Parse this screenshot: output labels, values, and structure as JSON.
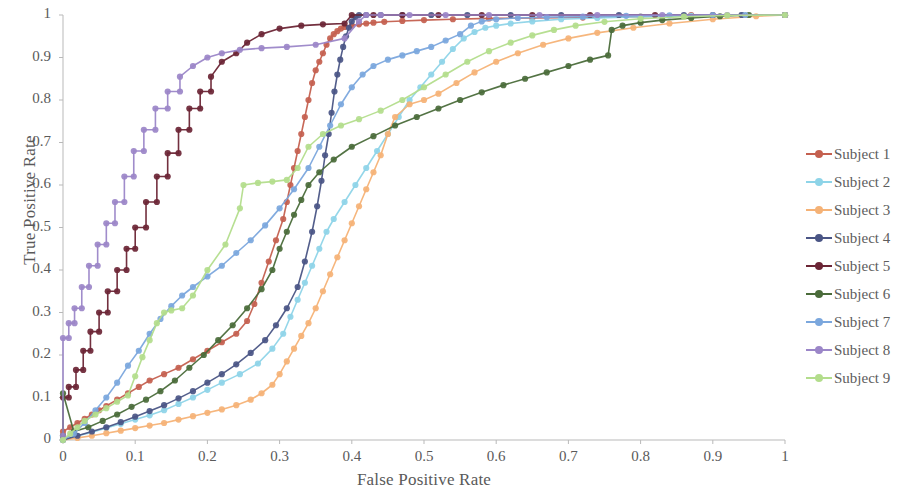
{
  "chart_data": {
    "type": "line",
    "title": "",
    "xlabel": "False Positive Rate",
    "ylabel": "True Positive Rate",
    "xlim": [
      0,
      1
    ],
    "ylim": [
      0,
      1
    ],
    "xticks": [
      "0",
      "0.1",
      "0.2",
      "0.3",
      "0.4",
      "0.5",
      "0.6",
      "0.7",
      "0.8",
      "0.9",
      "1"
    ],
    "yticks": [
      "0",
      "0.1",
      "0.2",
      "0.3",
      "0.4",
      "0.5",
      "0.6",
      "0.7",
      "0.8",
      "0.9",
      "1"
    ],
    "grid": false,
    "legend_position": "right",
    "marker": "circle",
    "series": [
      {
        "name": "Subject 1",
        "color": "#c4604f",
        "x": [
          0.0,
          0.01,
          0.02,
          0.03,
          0.04,
          0.05,
          0.06,
          0.075,
          0.09,
          0.105,
          0.12,
          0.14,
          0.16,
          0.18,
          0.2,
          0.22,
          0.24,
          0.255,
          0.265,
          0.275,
          0.285,
          0.295,
          0.305,
          0.31,
          0.315,
          0.32,
          0.325,
          0.33,
          0.335,
          0.34,
          0.345,
          0.35,
          0.355,
          0.36,
          0.365,
          0.37,
          0.375,
          0.38,
          0.385,
          0.39,
          0.4,
          0.41,
          0.42,
          0.43,
          0.445,
          0.47,
          0.5,
          0.54,
          0.59,
          0.65,
          0.72,
          0.8,
          0.87,
          0.94,
          1.0
        ],
        "y": [
          0.02,
          0.03,
          0.04,
          0.05,
          0.06,
          0.07,
          0.08,
          0.095,
          0.11,
          0.125,
          0.14,
          0.155,
          0.17,
          0.19,
          0.21,
          0.23,
          0.25,
          0.28,
          0.32,
          0.37,
          0.42,
          0.47,
          0.52,
          0.56,
          0.6,
          0.64,
          0.68,
          0.72,
          0.76,
          0.8,
          0.84,
          0.87,
          0.89,
          0.91,
          0.93,
          0.945,
          0.955,
          0.962,
          0.968,
          0.972,
          0.975,
          0.978,
          0.98,
          0.982,
          0.984,
          0.986,
          0.988,
          0.99,
          0.992,
          0.993,
          0.994,
          0.996,
          1.0,
          1.0,
          1.0
        ]
      },
      {
        "name": "Subject 2",
        "color": "#8ed4e8",
        "x": [
          0.0,
          0.02,
          0.04,
          0.06,
          0.08,
          0.1,
          0.12,
          0.14,
          0.16,
          0.18,
          0.2,
          0.22,
          0.245,
          0.27,
          0.29,
          0.305,
          0.315,
          0.325,
          0.335,
          0.345,
          0.355,
          0.365,
          0.375,
          0.39,
          0.405,
          0.42,
          0.435,
          0.45,
          0.465,
          0.48,
          0.495,
          0.51,
          0.525,
          0.54,
          0.555,
          0.57,
          0.585,
          0.6,
          0.62,
          0.65,
          0.69,
          0.74,
          0.8,
          0.87,
          0.94,
          1.0
        ],
        "y": [
          0.0,
          0.01,
          0.018,
          0.028,
          0.038,
          0.048,
          0.058,
          0.07,
          0.085,
          0.1,
          0.118,
          0.135,
          0.155,
          0.18,
          0.215,
          0.25,
          0.29,
          0.33,
          0.37,
          0.41,
          0.45,
          0.49,
          0.52,
          0.56,
          0.6,
          0.64,
          0.68,
          0.72,
          0.76,
          0.8,
          0.83,
          0.86,
          0.89,
          0.92,
          0.945,
          0.96,
          0.97,
          0.975,
          0.98,
          0.985,
          0.99,
          0.993,
          0.996,
          0.998,
          1.0,
          1.0
        ]
      },
      {
        "name": "Subject 3",
        "color": "#f5b276",
        "x": [
          0.0,
          0.02,
          0.04,
          0.06,
          0.08,
          0.1,
          0.12,
          0.14,
          0.16,
          0.18,
          0.2,
          0.22,
          0.24,
          0.26,
          0.275,
          0.29,
          0.3,
          0.31,
          0.32,
          0.33,
          0.34,
          0.35,
          0.36,
          0.37,
          0.38,
          0.39,
          0.4,
          0.41,
          0.42,
          0.43,
          0.44,
          0.45,
          0.46,
          0.48,
          0.5,
          0.52,
          0.545,
          0.57,
          0.6,
          0.63,
          0.665,
          0.7,
          0.74,
          0.79,
          0.84,
          0.9,
          0.96,
          1.0
        ],
        "y": [
          0.0,
          0.005,
          0.01,
          0.016,
          0.022,
          0.028,
          0.034,
          0.04,
          0.048,
          0.056,
          0.064,
          0.072,
          0.082,
          0.095,
          0.11,
          0.13,
          0.155,
          0.185,
          0.215,
          0.245,
          0.275,
          0.31,
          0.35,
          0.39,
          0.43,
          0.47,
          0.51,
          0.55,
          0.59,
          0.63,
          0.67,
          0.72,
          0.76,
          0.79,
          0.8,
          0.815,
          0.84,
          0.865,
          0.89,
          0.91,
          0.93,
          0.945,
          0.958,
          0.97,
          0.98,
          0.99,
          0.997,
          1.0
        ]
      },
      {
        "name": "Subject 4",
        "color": "#4a5585",
        "x": [
          0.0,
          0.02,
          0.04,
          0.06,
          0.08,
          0.1,
          0.12,
          0.14,
          0.16,
          0.18,
          0.2,
          0.22,
          0.24,
          0.26,
          0.28,
          0.295,
          0.31,
          0.325,
          0.335,
          0.345,
          0.352,
          0.358,
          0.363,
          0.368,
          0.372,
          0.376,
          0.38,
          0.384,
          0.388,
          0.392,
          0.396,
          0.4,
          0.405,
          0.41,
          0.42,
          0.44,
          0.47,
          0.51,
          0.56,
          0.62,
          0.69,
          0.77,
          0.86,
          0.94,
          1.0
        ],
        "y": [
          0.0,
          0.01,
          0.02,
          0.03,
          0.042,
          0.055,
          0.068,
          0.082,
          0.098,
          0.115,
          0.135,
          0.155,
          0.178,
          0.205,
          0.235,
          0.27,
          0.31,
          0.36,
          0.42,
          0.49,
          0.55,
          0.61,
          0.67,
          0.72,
          0.77,
          0.82,
          0.86,
          0.895,
          0.925,
          0.95,
          0.97,
          0.985,
          0.995,
          1.0,
          1.0,
          1.0,
          1.0,
          1.0,
          1.0,
          1.0,
          1.0,
          1.0,
          1.0,
          1.0,
          1.0
        ]
      },
      {
        "name": "Subject 5",
        "color": "#6b2535",
        "x": [
          0.0,
          0.0,
          0.008,
          0.008,
          0.018,
          0.018,
          0.028,
          0.028,
          0.038,
          0.038,
          0.05,
          0.05,
          0.062,
          0.062,
          0.075,
          0.075,
          0.088,
          0.088,
          0.1,
          0.1,
          0.115,
          0.115,
          0.13,
          0.13,
          0.145,
          0.145,
          0.16,
          0.16,
          0.175,
          0.175,
          0.19,
          0.19,
          0.205,
          0.205,
          0.22,
          0.24,
          0.255,
          0.275,
          0.3,
          0.33,
          0.36,
          0.39,
          0.4,
          0.43,
          0.47,
          0.52,
          0.58,
          0.65,
          0.73,
          0.82,
          0.9,
          1.0
        ],
        "y": [
          0.01,
          0.1,
          0.1,
          0.125,
          0.125,
          0.165,
          0.165,
          0.21,
          0.21,
          0.255,
          0.255,
          0.3,
          0.3,
          0.35,
          0.35,
          0.4,
          0.4,
          0.45,
          0.45,
          0.5,
          0.5,
          0.56,
          0.56,
          0.62,
          0.62,
          0.675,
          0.675,
          0.73,
          0.73,
          0.78,
          0.78,
          0.82,
          0.82,
          0.855,
          0.89,
          0.91,
          0.935,
          0.955,
          0.968,
          0.975,
          0.978,
          0.98,
          1.0,
          1.0,
          1.0,
          1.0,
          1.0,
          1.0,
          1.0,
          1.0,
          1.0,
          1.0
        ]
      },
      {
        "name": "Subject 6",
        "color": "#4a6b3a",
        "x": [
          0.0,
          0.0,
          0.015,
          0.035,
          0.055,
          0.075,
          0.095,
          0.115,
          0.135,
          0.155,
          0.175,
          0.195,
          0.215,
          0.235,
          0.255,
          0.275,
          0.29,
          0.3,
          0.31,
          0.32,
          0.33,
          0.34,
          0.355,
          0.375,
          0.4,
          0.43,
          0.46,
          0.49,
          0.52,
          0.55,
          0.58,
          0.61,
          0.64,
          0.67,
          0.7,
          0.73,
          0.755,
          0.76,
          0.775,
          0.8,
          0.83,
          0.87,
          0.91,
          0.95,
          1.0
        ],
        "y": [
          0.01,
          0.11,
          0.02,
          0.03,
          0.045,
          0.06,
          0.078,
          0.095,
          0.115,
          0.14,
          0.17,
          0.2,
          0.235,
          0.27,
          0.31,
          0.355,
          0.4,
          0.45,
          0.49,
          0.53,
          0.565,
          0.6,
          0.63,
          0.66,
          0.69,
          0.715,
          0.74,
          0.76,
          0.78,
          0.8,
          0.818,
          0.835,
          0.85,
          0.865,
          0.88,
          0.895,
          0.905,
          0.965,
          0.975,
          0.982,
          0.988,
          0.993,
          0.997,
          1.0,
          1.0
        ]
      },
      {
        "name": "Subject 7",
        "color": "#7ba7dd",
        "x": [
          0.0,
          0.015,
          0.03,
          0.045,
          0.06,
          0.075,
          0.09,
          0.105,
          0.12,
          0.135,
          0.15,
          0.165,
          0.18,
          0.2,
          0.22,
          0.24,
          0.26,
          0.28,
          0.3,
          0.32,
          0.34,
          0.355,
          0.37,
          0.385,
          0.4,
          0.415,
          0.43,
          0.45,
          0.47,
          0.49,
          0.51,
          0.53,
          0.55,
          0.565,
          0.58,
          0.6,
          0.63,
          0.67,
          0.72,
          0.78,
          0.84,
          0.9,
          0.945,
          1.0
        ],
        "y": [
          0.0,
          0.015,
          0.04,
          0.07,
          0.1,
          0.135,
          0.175,
          0.21,
          0.25,
          0.285,
          0.315,
          0.34,
          0.36,
          0.385,
          0.41,
          0.44,
          0.47,
          0.505,
          0.545,
          0.59,
          0.64,
          0.69,
          0.74,
          0.79,
          0.83,
          0.86,
          0.88,
          0.895,
          0.905,
          0.915,
          0.925,
          0.94,
          0.955,
          0.975,
          0.985,
          0.99,
          0.993,
          0.995,
          0.996,
          0.998,
          0.999,
          1.0,
          1.0,
          1.0
        ]
      },
      {
        "name": "Subject 8",
        "color": "#9b86c8",
        "x": [
          0.0,
          0.0,
          0.008,
          0.008,
          0.016,
          0.016,
          0.026,
          0.026,
          0.036,
          0.036,
          0.048,
          0.048,
          0.06,
          0.06,
          0.072,
          0.072,
          0.085,
          0.085,
          0.098,
          0.098,
          0.112,
          0.112,
          0.128,
          0.128,
          0.145,
          0.145,
          0.162,
          0.162,
          0.18,
          0.2,
          0.22,
          0.245,
          0.275,
          0.31,
          0.35,
          0.39,
          0.41,
          0.42,
          0.44,
          0.48,
          0.53,
          0.59,
          0.66,
          0.74,
          0.83,
          0.92,
          1.0
        ],
        "y": [
          0.01,
          0.24,
          0.24,
          0.275,
          0.275,
          0.31,
          0.31,
          0.36,
          0.36,
          0.41,
          0.41,
          0.46,
          0.46,
          0.51,
          0.51,
          0.56,
          0.56,
          0.62,
          0.62,
          0.68,
          0.68,
          0.73,
          0.73,
          0.78,
          0.78,
          0.82,
          0.82,
          0.855,
          0.88,
          0.9,
          0.91,
          0.918,
          0.922,
          0.925,
          0.93,
          0.945,
          0.985,
          1.0,
          1.0,
          1.0,
          1.0,
          1.0,
          1.0,
          1.0,
          1.0,
          1.0,
          1.0
        ]
      },
      {
        "name": "Subject 9",
        "color": "#b3dd8c",
        "x": [
          0.0,
          0.01,
          0.02,
          0.03,
          0.045,
          0.06,
          0.075,
          0.09,
          0.1,
          0.11,
          0.12,
          0.13,
          0.14,
          0.15,
          0.165,
          0.18,
          0.2,
          0.225,
          0.245,
          0.25,
          0.27,
          0.29,
          0.31,
          0.325,
          0.34,
          0.36,
          0.385,
          0.41,
          0.44,
          0.47,
          0.5,
          0.53,
          0.56,
          0.59,
          0.62,
          0.65,
          0.68,
          0.71,
          0.75,
          0.8,
          0.86,
          0.92,
          1.0
        ],
        "y": [
          0.0,
          0.015,
          0.03,
          0.045,
          0.06,
          0.075,
          0.09,
          0.105,
          0.15,
          0.195,
          0.235,
          0.275,
          0.3,
          0.305,
          0.31,
          0.34,
          0.4,
          0.46,
          0.545,
          0.6,
          0.605,
          0.608,
          0.612,
          0.64,
          0.69,
          0.72,
          0.74,
          0.755,
          0.775,
          0.8,
          0.83,
          0.86,
          0.89,
          0.915,
          0.935,
          0.952,
          0.965,
          0.975,
          0.984,
          0.991,
          0.996,
          0.999,
          1.0
        ]
      }
    ]
  },
  "legend": {
    "items": [
      {
        "label": "Subject 1",
        "color": "#c4604f"
      },
      {
        "label": "Subject 2",
        "color": "#8ed4e8"
      },
      {
        "label": "Subject 3",
        "color": "#f5b276"
      },
      {
        "label": "Subject 4",
        "color": "#4a5585"
      },
      {
        "label": "Subject 5",
        "color": "#6b2535"
      },
      {
        "label": "Subject 6",
        "color": "#4a6b3a"
      },
      {
        "label": "Subject 7",
        "color": "#7ba7dd"
      },
      {
        "label": "Subject 8",
        "color": "#9b86c8"
      },
      {
        "label": "Subject 9",
        "color": "#b3dd8c"
      }
    ]
  }
}
